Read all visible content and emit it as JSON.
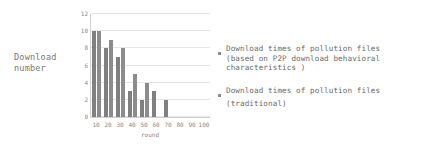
{
  "chart_data": {
    "type": "bar",
    "title": "",
    "xlabel": "round",
    "ylabel": "Download number",
    "categories": [
      "10",
      "20",
      "30",
      "40",
      "50",
      "60",
      "70",
      "80",
      "90",
      "100"
    ],
    "yticks": [
      0,
      2,
      4,
      6,
      8,
      10,
      12
    ],
    "ylim": [
      0,
      12
    ],
    "grid": true,
    "legend_position": "right",
    "series": [
      {
        "name": "Download times of pollution files (based on P2P download behavioral characteristics )",
        "color": "#808080",
        "values": [
          10,
          8,
          7,
          3,
          2,
          3,
          2,
          0,
          0,
          0
        ]
      },
      {
        "name": "Download times of pollution files (traditional)",
        "color": "#8c8c8c",
        "values": [
          10,
          9,
          8,
          5,
          4,
          0,
          0,
          0,
          0,
          0
        ]
      }
    ]
  },
  "axes": {
    "y_caption_line1": "Download",
    "y_caption_line2": "number",
    "x_caption": "round"
  },
  "legend": {
    "entries": [
      {
        "line1": "Download times of pollution files",
        "line2": "(based on P2P download behavioral",
        "line3": "characteristics )"
      },
      {
        "line1": "Download times of pollution files",
        "line2": "(traditional)"
      }
    ]
  }
}
